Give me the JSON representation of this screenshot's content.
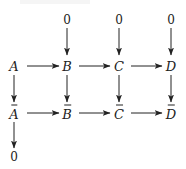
{
  "diagram": {
    "type": "commutative-diagram",
    "colors": {
      "ink": "#222222",
      "background": "#ffffff"
    },
    "nodes": {
      "top0_B": "0",
      "top0_C": "0",
      "top0_D": "0",
      "A": "A",
      "B": "B",
      "C": "C",
      "D": "D",
      "Abar": "A",
      "Bbar": "B",
      "Cbar": "C",
      "Dbar": "D",
      "bottom0_A": "0"
    },
    "edges": [
      {
        "from": "0",
        "to": "B",
        "direction": "down"
      },
      {
        "from": "0",
        "to": "C",
        "direction": "down"
      },
      {
        "from": "0",
        "to": "D",
        "direction": "down"
      },
      {
        "from": "A",
        "to": "B",
        "direction": "right"
      },
      {
        "from": "B",
        "to": "C",
        "direction": "right"
      },
      {
        "from": "C",
        "to": "D",
        "direction": "right"
      },
      {
        "from": "A",
        "to": "Ā",
        "direction": "down"
      },
      {
        "from": "B",
        "to": "B̄",
        "direction": "down"
      },
      {
        "from": "C",
        "to": "C̄",
        "direction": "down"
      },
      {
        "from": "D",
        "to": "D̄",
        "direction": "down"
      },
      {
        "from": "Ā",
        "to": "B̄",
        "direction": "right"
      },
      {
        "from": "B̄",
        "to": "C̄",
        "direction": "right"
      },
      {
        "from": "C̄",
        "to": "D̄",
        "direction": "right"
      },
      {
        "from": "Ā",
        "to": "0",
        "direction": "down"
      }
    ]
  }
}
